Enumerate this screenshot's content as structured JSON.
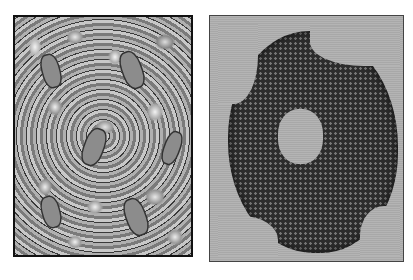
{
  "figure": {
    "top_fragment": "",
    "panels": [
      {
        "id": "left",
        "description": "grayscale surface rendering of tiled molecular lattice with elongated channels"
      },
      {
        "id": "right",
        "description": "space-filling atomic model of a ring-shaped protein complex with central pore"
      }
    ],
    "caption_fragment": ""
  }
}
